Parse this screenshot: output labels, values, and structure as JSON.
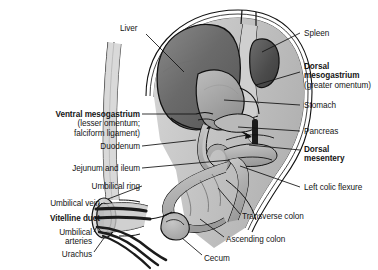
{
  "figure": {
    "background": "#ffffff",
    "width": 378,
    "height": 270
  },
  "palette": {
    "outline": "#111111",
    "body_wall": "#c9c9c9",
    "cavity_light": "#d8d8d8",
    "liver_dark": "#6e6e6e",
    "stomach_mid": "#a8a8a8",
    "spleen_dark": "#4e4e4e",
    "mesentery_bar": "#1a1a1a",
    "gut_fill": "#b5b5b5",
    "text": "#151515"
  },
  "labels": {
    "left": [
      {
        "id": "ventral-mesogastrium",
        "text": "Ventral mesogastrium",
        "sub": "(lesser omentum;\nfalciform ligament)",
        "bold": true,
        "x": 12,
        "y": 110,
        "width": 128,
        "leader": {
          "x1": 142,
          "y1": 114,
          "x2": 196,
          "y2": 114
        }
      },
      {
        "id": "duodenum",
        "text": "Duodenum",
        "bold": false,
        "x": 60,
        "y": 142,
        "width": 80,
        "leader": {
          "x1": 142,
          "y1": 146,
          "x2": 196,
          "y2": 140
        }
      },
      {
        "id": "jejunum-and-ileum",
        "text": "Jejunum and ileum",
        "bold": false,
        "x": 20,
        "y": 164,
        "width": 120,
        "leader": {
          "x1": 142,
          "y1": 168,
          "x2": 230,
          "y2": 160
        }
      },
      {
        "id": "umbilical-ring",
        "text": "Umbilical ring",
        "bold": false,
        "x": 38,
        "y": 182,
        "width": 102,
        "leader": {
          "x1": 142,
          "y1": 186,
          "x2": 108,
          "y2": 199
        }
      },
      {
        "id": "umbilical-vein",
        "text": "Umbilical vein",
        "bold": false,
        "x": 8,
        "y": 199,
        "width": 92,
        "leader": {
          "x1": 102,
          "y1": 203,
          "x2": 96,
          "y2": 209
        }
      },
      {
        "id": "vitelline-duct",
        "text": "Vitelline duct",
        "bold": true,
        "x": 8,
        "y": 214,
        "width": 92,
        "leader": {
          "x1": 102,
          "y1": 218,
          "x2": 95,
          "y2": 218
        }
      },
      {
        "id": "umbilical-arteries",
        "text": "Umbilical\narteries",
        "bold": false,
        "x": 30,
        "y": 228,
        "width": 62,
        "leader": {
          "x1": 94,
          "y1": 232,
          "x2": 96,
          "y2": 228
        }
      },
      {
        "id": "urachus",
        "text": "Urachus",
        "bold": false,
        "x": 30,
        "y": 250,
        "width": 62,
        "leader": {
          "x1": 94,
          "y1": 252,
          "x2": 104,
          "y2": 238
        }
      }
    ],
    "right": [
      {
        "id": "liver",
        "text": "Liver",
        "bold": false,
        "x": 120,
        "y": 24,
        "width": 40,
        "leader": {
          "x1": 146,
          "y1": 34,
          "x2": 184,
          "y2": 72
        }
      },
      {
        "id": "spleen",
        "text": "Spleen",
        "bold": false,
        "x": 304,
        "y": 29,
        "width": 70,
        "leader": {
          "x1": 300,
          "y1": 33,
          "x2": 262,
          "y2": 52
        }
      },
      {
        "id": "dorsal-mesogastrium",
        "text": "Dorsal\nmesogastrium",
        "sub": "(greater omentum)",
        "bold": true,
        "x": 304,
        "y": 62,
        "width": 74,
        "leader": {
          "x1": 300,
          "y1": 72,
          "x2": 256,
          "y2": 85
        }
      },
      {
        "id": "stomach",
        "text": "Stomach",
        "bold": false,
        "x": 304,
        "y": 101,
        "width": 70,
        "leader": {
          "x1": 300,
          "y1": 105,
          "x2": 224,
          "y2": 100
        }
      },
      {
        "id": "pancreas",
        "text": "Pancreas",
        "bold": false,
        "x": 304,
        "y": 127,
        "width": 70,
        "leader": {
          "x1": 300,
          "y1": 131,
          "x2": 238,
          "y2": 127
        }
      },
      {
        "id": "dorsal-mesentery",
        "text": "Dorsal\nmesentery",
        "bold": true,
        "x": 304,
        "y": 145,
        "width": 74,
        "leader": {
          "x1": 300,
          "y1": 150,
          "x2": 249,
          "y2": 145
        }
      },
      {
        "id": "left-colic-flexure",
        "text": "Left colic flexure",
        "bold": false,
        "x": 304,
        "y": 183,
        "width": 74,
        "leader": {
          "x1": 300,
          "y1": 187,
          "x2": 240,
          "y2": 166
        }
      },
      {
        "id": "transverse-colon",
        "text": "Transverse colon",
        "bold": false,
        "x": 242,
        "y": 212,
        "width": 100,
        "leader": {
          "x1": 240,
          "y1": 214,
          "x2": 218,
          "y2": 188
        }
      },
      {
        "id": "ascending-colon",
        "text": "Ascending colon",
        "bold": false,
        "x": 226,
        "y": 235,
        "width": 100,
        "leader": {
          "x1": 224,
          "y1": 237,
          "x2": 200,
          "y2": 219
        }
      },
      {
        "id": "cecum",
        "text": "Cecum",
        "bold": false,
        "x": 204,
        "y": 254,
        "width": 60,
        "leader": {
          "x1": 202,
          "y1": 255,
          "x2": 182,
          "y2": 238
        }
      }
    ]
  }
}
